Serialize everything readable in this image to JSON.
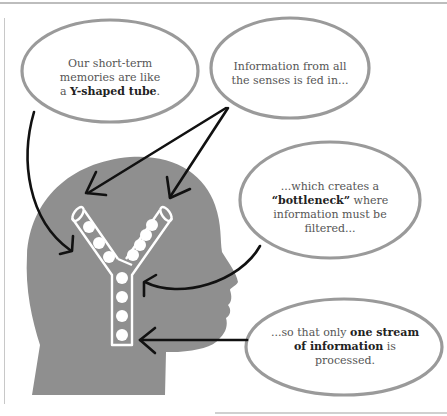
{
  "diagram": {
    "colors": {
      "head": "#8f8f8f",
      "bubble_stroke": "#9a9a9a",
      "arrow": "#111111",
      "tube": "#ffffff",
      "text": "#555555",
      "bold_text": "#222222"
    },
    "bubbles": [
      {
        "id": "y-shaped-tube",
        "line1": "Our short-term",
        "line2": "memories are like",
        "line3_pre": "a ",
        "line3_bold": "Y-shaped tube",
        "line3_post": "."
      },
      {
        "id": "senses",
        "line1": "Information from all",
        "line2": "the senses is fed in..."
      },
      {
        "id": "bottleneck",
        "line1": "...which creates a",
        "line2_bold": "“bottleneck”",
        "line2_post": " where",
        "line3": "information must be",
        "line4": "filtered..."
      },
      {
        "id": "one-stream",
        "line1_pre": "...so that only ",
        "line1_bold": "one stream",
        "line2_bold": "of information",
        "line2_post": " is",
        "line3": "processed."
      }
    ],
    "nodes": {
      "head": "head-silhouette",
      "tube": "y-shaped-tube",
      "balls_left_branch": 3,
      "balls_right_branch": 4,
      "balls_stem": 4
    }
  }
}
